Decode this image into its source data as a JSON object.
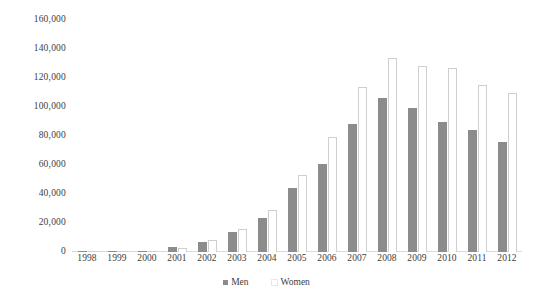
{
  "chart_data": {
    "type": "bar",
    "title": "",
    "subtitle": "",
    "xlabel": "",
    "ylabel": "",
    "categories": [
      "1998",
      "1999",
      "2000",
      "2001",
      "2002",
      "2003",
      "2004",
      "2005",
      "2006",
      "2007",
      "2008",
      "2009",
      "2010",
      "2011",
      "2012"
    ],
    "series": [
      {
        "name": "Men",
        "color": "#8c8c8c",
        "values": [
          500,
          600,
          1000,
          3500,
          7000,
          13500,
          23500,
          44000,
          61000,
          88000,
          106000,
          99000,
          90000,
          84000,
          76000
        ]
      },
      {
        "name": "Women",
        "color": "#ffffff",
        "values": [
          400,
          500,
          800,
          3000,
          8500,
          16000,
          29000,
          53000,
          79000,
          114000,
          134000,
          128000,
          127000,
          115000,
          110000
        ]
      }
    ],
    "ylim": [
      0,
      160000
    ],
    "y_ticks": [
      0,
      20000,
      40000,
      60000,
      80000,
      100000,
      120000,
      140000,
      160000
    ],
    "y_tick_labels": [
      "0",
      "20,000",
      "40,000",
      "60,000",
      "80,000",
      "100,000",
      "120,000",
      "140,000",
      "160,000"
    ],
    "grid": false,
    "legend_position": "bottom"
  },
  "legend": {
    "items": [
      {
        "label": "Men",
        "swatch": "men-swatch-icon"
      },
      {
        "label": "Women",
        "swatch": "women-swatch-icon"
      }
    ]
  }
}
